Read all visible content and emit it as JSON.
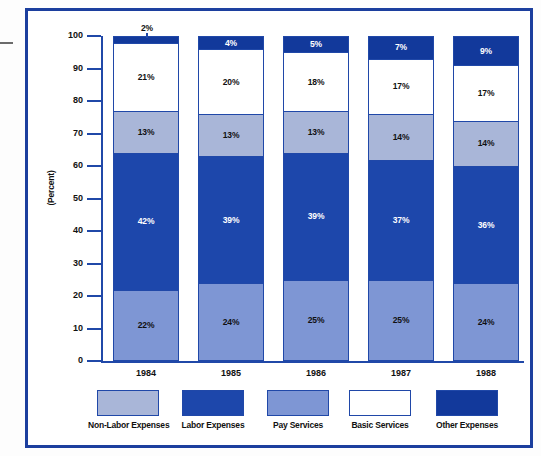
{
  "frame": {
    "border_color": "#1c3f9e",
    "background": "#ffffff"
  },
  "axis": {
    "y_title": "(Percent)",
    "y_ticks": [
      "100",
      "90",
      "80",
      "70",
      "60",
      "50",
      "40",
      "30",
      "20",
      "10",
      "0"
    ],
    "axis_color": "#2048a8"
  },
  "legend": {
    "items": [
      {
        "label": "Non-Labor Expenses",
        "color": "#a9b6d8"
      },
      {
        "label": "Labor Expenses",
        "color": "#1d47ab"
      },
      {
        "label": "Pay Services",
        "color": "#7e96d4"
      },
      {
        "label": "Basic Services",
        "color": "#ffffff"
      },
      {
        "label": "Other Expenses",
        "color": "#12399b"
      }
    ]
  },
  "chart_data": {
    "type": "bar",
    "subtype": "stacked-100-percent",
    "title": "",
    "xlabel": "",
    "ylabel": "(Percent)",
    "ylim": [
      0,
      100
    ],
    "ytick_step": 10,
    "grid": false,
    "legend_position": "bottom",
    "categories": [
      "1984",
      "1985",
      "1986",
      "1987",
      "1988"
    ],
    "series": [
      {
        "name": "Pay Services",
        "color": "#7e96d4",
        "text_color": "dark",
        "values": [
          22,
          24,
          25,
          25,
          24
        ],
        "labels": [
          "22%",
          "24%",
          "25%",
          "25%",
          "24%"
        ]
      },
      {
        "name": "Labor Expenses",
        "color": "#1d47ab",
        "text_color": "light",
        "values": [
          42,
          39,
          39,
          37,
          36
        ],
        "labels": [
          "42%",
          "39%",
          "39%",
          "37%",
          "36%"
        ]
      },
      {
        "name": "Non-Labor Expenses",
        "color": "#a9b6d8",
        "text_color": "dark",
        "values": [
          13,
          13,
          13,
          14,
          14
        ],
        "labels": [
          "13%",
          "13%",
          "13%",
          "14%",
          "14%"
        ]
      },
      {
        "name": "Basic Services",
        "color": "#ffffff",
        "text_color": "dark",
        "values": [
          21,
          20,
          18,
          17,
          17
        ],
        "labels": [
          "21%",
          "20%",
          "18%",
          "17%",
          "17%"
        ]
      },
      {
        "name": "Other Expenses",
        "color": "#12399b",
        "text_color": "light",
        "values": [
          2,
          4,
          5,
          7,
          9
        ],
        "labels": [
          "2%",
          "4%",
          "5%",
          "7%",
          "9%"
        ],
        "label_outside": [
          true,
          false,
          false,
          false,
          false
        ]
      }
    ]
  }
}
